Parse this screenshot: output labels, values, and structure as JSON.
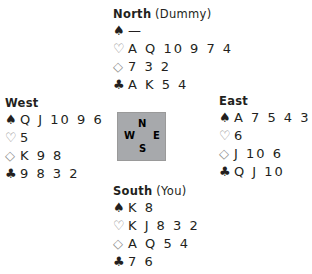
{
  "suits": {
    "spades": "♠",
    "hearts": "♡",
    "diamonds": "◇",
    "clubs": "♣"
  },
  "compass": {
    "n": "N",
    "s": "S",
    "e": "E",
    "w": "W",
    "color": "#a7a9ac"
  },
  "north": {
    "name": "North",
    "role": "(Dummy)",
    "spades": "—",
    "hearts": "A Q 10 9 7 4",
    "diamonds": "7 3 2",
    "clubs": "A K 5 4"
  },
  "west": {
    "name": "West",
    "role": "",
    "spades": "Q J 10 9 6",
    "hearts": "5",
    "diamonds": "K 9 8",
    "clubs": "9 8 3 2"
  },
  "east": {
    "name": "East",
    "role": "",
    "spades": "A 7 5 4 3 2",
    "hearts": "6",
    "diamonds": "J 10 6",
    "clubs": "Q J 10"
  },
  "south": {
    "name": "South",
    "role": "(You)",
    "spades": "K 8",
    "hearts": "K J 8 3 2",
    "diamonds": "A Q 5 4",
    "clubs": "7 6"
  }
}
